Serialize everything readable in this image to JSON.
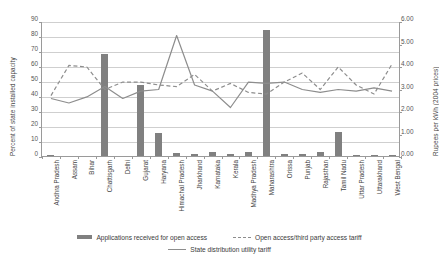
{
  "chart_data": {
    "type": "bar",
    "title": "",
    "xlabel": "",
    "ylabel": "Percent of state installed capacity",
    "y2label": "Rupees per kWh (2004 prices)",
    "ylim": [
      0,
      90
    ],
    "y2lim": [
      0,
      6
    ],
    "grid": true,
    "legend_position": "bottom",
    "categories": [
      "Andhra Pradesh",
      "Assam",
      "Bihar",
      "Chattisgarh",
      "Delhi",
      "Gujarat",
      "Haryana",
      "Himachal Pradesh",
      "Jharkhand",
      "Karnataka",
      "Kerala",
      "Madhya Pradesh",
      "Maharashtra",
      "Orissa",
      "Punjab",
      "Rajasthan",
      "Tamil Nadu",
      "Uttar Pradesh",
      "Uttarakhand",
      "West Bengal"
    ],
    "yticks": [
      "0",
      "10",
      "20",
      "30",
      "40",
      "50",
      "60",
      "70",
      "80",
      "90"
    ],
    "y2ticks": [
      "0.00",
      "1.00",
      "2.00",
      "3.00",
      "4.00",
      "5.00",
      "6.00"
    ],
    "series": [
      {
        "name": "Applications received for open access",
        "type": "bar",
        "axis": "left",
        "color": "#808080",
        "values": [
          1,
          0,
          0,
          68,
          0,
          47.5,
          15.5,
          2,
          1.5,
          2.5,
          1.5,
          2.5,
          84,
          1.5,
          1.5,
          3,
          16,
          1,
          1,
          1
        ]
      },
      {
        "name": "Open access/third party access tariff",
        "type": "line",
        "style": "dashed",
        "axis": "right",
        "color": "#8d8d8d",
        "values": [
          2.73,
          4.07,
          4.0,
          3.0,
          3.33,
          3.33,
          3.2,
          3.13,
          3.67,
          2.93,
          3.27,
          2.87,
          2.8,
          3.33,
          3.73,
          3.0,
          4.0,
          3.2,
          2.8,
          4.13
        ]
      },
      {
        "name": "State distribution utility tariff",
        "type": "line",
        "style": "solid",
        "axis": "right",
        "color": "#8d8d8d",
        "values": [
          2.6,
          2.4,
          2.67,
          3.13,
          2.6,
          2.93,
          3.0,
          5.4,
          3.2,
          2.93,
          2.2,
          3.33,
          3.27,
          3.33,
          3.0,
          2.87,
          3.0,
          2.93,
          3.07,
          2.93
        ]
      }
    ]
  },
  "legend": {
    "items": [
      {
        "label": "Applications received for open access"
      },
      {
        "label": "Open access/third party access tariff"
      },
      {
        "label": "State distribution utility tariff"
      }
    ]
  }
}
